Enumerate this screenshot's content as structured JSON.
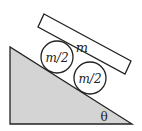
{
  "diagram": {
    "plank_label": "m",
    "cylinder_top_label": "m/2",
    "cylinder_bottom_label": "m/2",
    "angle_label": "θ",
    "colors": {
      "incline_fill": "#d4d4d4",
      "stroke": "#222222",
      "background": "#ffffff"
    }
  }
}
